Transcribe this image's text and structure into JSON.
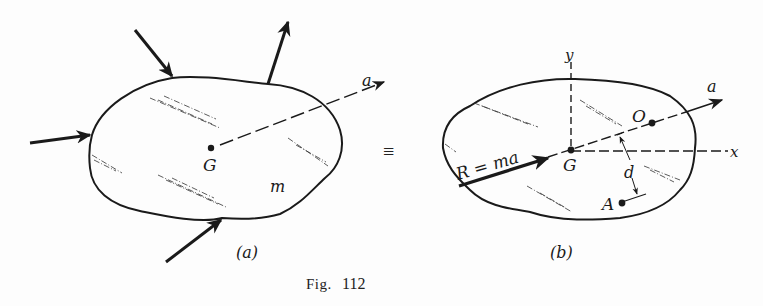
{
  "figure": {
    "caption_prefix": "Fig.",
    "caption_number": "112",
    "equivalence_symbol": "≡",
    "ink_color": "#1a1a1a",
    "background": "#fdfdfd"
  },
  "panel_a": {
    "label": "(a)",
    "centroid_label": "G",
    "mass_label": "m",
    "acceleration_label": "a",
    "external_forces_count": 4
  },
  "panel_b": {
    "label": "(b)",
    "centroid_label": "G",
    "resultant_label": "R = ma",
    "acceleration_label": "a",
    "point_o_label": "O",
    "point_a_label": "A",
    "distance_label": "d",
    "x_axis_label": "x",
    "y_axis_label": "y"
  }
}
